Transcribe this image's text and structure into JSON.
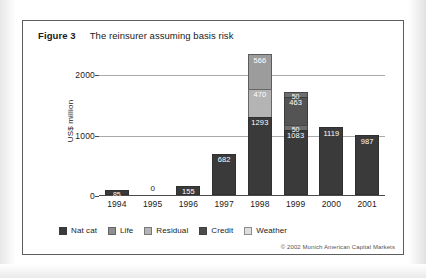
{
  "figure": {
    "label": "Figure 3",
    "title": "The reinsurer assuming basis risk",
    "copyright": "© 2002  Munich American Capital Markets"
  },
  "chart_data": {
    "type": "bar",
    "stacked": true,
    "title": "The reinsurer assuming basis risk",
    "xlabel": "",
    "ylabel": "US$ million",
    "ylim": [
      0,
      2400
    ],
    "yticks": [
      0,
      1000,
      2000
    ],
    "ytick_labels": [
      "0",
      "1000",
      "2000"
    ],
    "grid": "horizontal",
    "legend_position": "bottom",
    "categories": [
      "1994",
      "1995",
      "1996",
      "1997",
      "1998",
      "1999",
      "2000",
      "2001"
    ],
    "series": [
      {
        "name": "Nat cat",
        "color": "#3a3a3a",
        "values": [
          85,
          0,
          155,
          682,
          1293,
          1083,
          1119,
          987
        ]
      },
      {
        "name": "Life",
        "color": "#8f8f8f",
        "values": [
          0,
          0,
          0,
          0,
          0,
          463,
          0,
          0
        ]
      },
      {
        "name": "Residual",
        "color": "#b4b4b4",
        "values": [
          0,
          0,
          0,
          0,
          470,
          50,
          0,
          0
        ]
      },
      {
        "name": "Credit",
        "color": "#606060",
        "values": [
          0,
          0,
          0,
          0,
          0,
          0,
          0,
          0
        ]
      },
      {
        "name": "Weather",
        "color": "#d8d8d8",
        "values": [
          0,
          0,
          0,
          0,
          566,
          50,
          0,
          0
        ]
      }
    ],
    "bars": [
      {
        "year": "1994",
        "segments": [
          {
            "label": "85",
            "value": 85,
            "series": "Nat cat",
            "color": "#3a3a3a"
          }
        ]
      },
      {
        "year": "1995",
        "segments": [],
        "zero_label": "0"
      },
      {
        "year": "1996",
        "segments": [
          {
            "label": "155",
            "value": 155,
            "series": "Nat cat",
            "color": "#3a3a3a"
          }
        ]
      },
      {
        "year": "1997",
        "segments": [
          {
            "label": "682",
            "value": 682,
            "series": "Nat cat",
            "color": "#3a3a3a"
          }
        ]
      },
      {
        "year": "1998",
        "segments": [
          {
            "label": "1293",
            "value": 1293,
            "series": "Nat cat",
            "color": "#3a3a3a"
          },
          {
            "label": "470",
            "value": 470,
            "series": "Residual",
            "color": "#b4b4b4"
          },
          {
            "label": "566",
            "value": 566,
            "series": "Weather",
            "color": "#9c9c9c"
          }
        ]
      },
      {
        "year": "1999",
        "segments": [
          {
            "label": "1083",
            "value": 1083,
            "series": "Nat cat",
            "color": "#3a3a3a"
          },
          {
            "label": "50",
            "value": 50,
            "series": "Residual",
            "color": "#6e6e6e"
          },
          {
            "label": "463",
            "value": 463,
            "series": "Life",
            "color": "#545454"
          },
          {
            "label": "50",
            "value": 50,
            "series": "Weather",
            "color": "#6e6e6e"
          }
        ]
      },
      {
        "year": "2000",
        "segments": [
          {
            "label": "1119",
            "value": 1119,
            "series": "Nat cat",
            "color": "#3a3a3a"
          }
        ]
      },
      {
        "year": "2001",
        "segments": [
          {
            "label": "987",
            "value": 987,
            "series": "Nat cat",
            "color": "#3a3a3a"
          }
        ]
      }
    ],
    "legend": [
      {
        "label": "Nat cat",
        "color": "#3a3a3a"
      },
      {
        "label": "Life",
        "color": "#8f8f8f"
      },
      {
        "label": "Residual",
        "color": "#b4b4b4"
      },
      {
        "label": "Credit",
        "color": "#4a4a4a"
      },
      {
        "label": "Weather",
        "color": "#dedede"
      }
    ]
  }
}
